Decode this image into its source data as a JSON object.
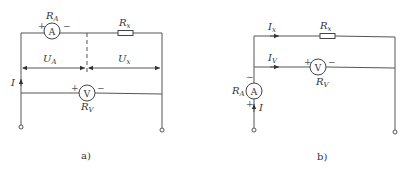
{
  "figure_a": {
    "caption": "a)",
    "ammeter": {
      "letter": "A",
      "label_main": "R",
      "label_sub": "A",
      "plus": "+",
      "minus": "−"
    },
    "resistor": {
      "label_main": "R",
      "label_sub": "x"
    },
    "voltage_a": {
      "label_main": "U",
      "label_sub": "A"
    },
    "voltage_x": {
      "label_main": "U",
      "label_sub": "x"
    },
    "current": {
      "label": "I"
    },
    "voltmeter": {
      "letter": "V",
      "label_main": "R",
      "label_sub": "V",
      "plus": "+",
      "minus": "−"
    }
  },
  "figure_b": {
    "caption": "b)",
    "current_x": {
      "label_main": "I",
      "label_sub": "x"
    },
    "resistor": {
      "label_main": "R",
      "label_sub": "x"
    },
    "current_v": {
      "label_main": "I",
      "label_sub": "V"
    },
    "voltmeter": {
      "letter": "V",
      "label_main": "R",
      "label_sub": "V",
      "plus": "+",
      "minus": "−"
    },
    "ammeter": {
      "letter": "A",
      "label_main": "R",
      "label_sub": "A",
      "plus": "+",
      "minus": "−"
    },
    "current": {
      "label": "I"
    }
  }
}
